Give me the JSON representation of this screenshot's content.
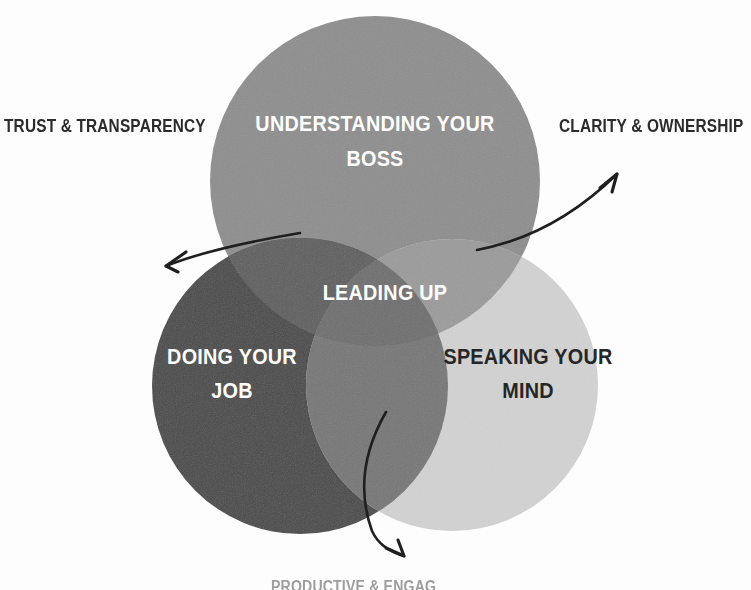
{
  "diagram": {
    "type": "venn-3-circle",
    "title_center": "LEADING UP",
    "background_color": "#fdfdfd",
    "circles": [
      {
        "id": "understanding-your-boss",
        "label_line1": "UNDERSTANDING YOUR",
        "label_line2": "BOSS",
        "color": "#8e8e8e",
        "text_color": "#ffffff",
        "cx": 375,
        "cy": 181,
        "r": 165
      },
      {
        "id": "doing-your-job",
        "label_line1": "DOING YOUR",
        "label_line2": "JOB",
        "color": "#4a4a4a",
        "text_color": "#ffffff",
        "cx": 300,
        "cy": 386,
        "r": 148
      },
      {
        "id": "speaking-your-mind",
        "label_line1": "SPEAKING YOUR",
        "label_line2": "MIND",
        "color": "#d2d2d2",
        "text_color": "#262626",
        "cx": 452,
        "cy": 385,
        "r": 146
      }
    ],
    "overlap_colors": {
      "top_left": "#5f5f5f",
      "top_right": "#9b9b9b",
      "left_right": "#777777",
      "center": "#6f6f6f"
    },
    "external_labels": [
      {
        "id": "trust-transparency",
        "text": "TRUST & TRANSPARENCY",
        "position": "upper-left",
        "arrow": "curved-arrow-to-upper-left"
      },
      {
        "id": "clarity-ownership",
        "text": "CLARITY & OWNERSHIP",
        "position": "upper-right",
        "arrow": "curved-arrow-to-upper-right"
      },
      {
        "id": "bottom-cropped-label",
        "text": "PRODUCTIVE & ENGAG",
        "position": "bottom",
        "arrow": "curved-arrow-to-bottom",
        "cropped": true
      }
    ],
    "arrow_color": "#1f1f1f"
  }
}
